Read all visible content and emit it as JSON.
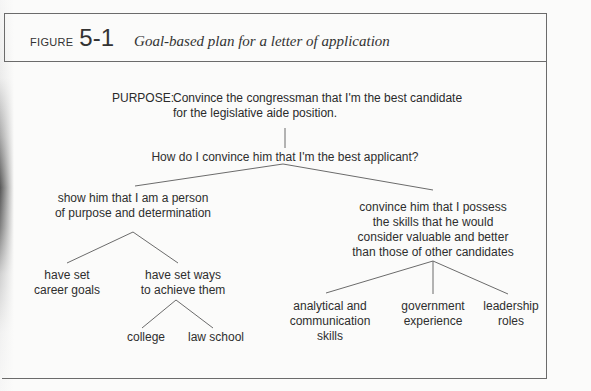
{
  "figure": {
    "label_word": "FIGURE",
    "number": "5-1",
    "caption": "Goal-based plan for a letter of application"
  },
  "purpose": {
    "label": "PURPOSE:",
    "line1": "Convince the congressman that I'm the best candidate",
    "line2": "for the legislative aide position."
  },
  "tree": {
    "question": "How do I convince him that I'm the best applicant?",
    "left": {
      "lines": [
        "show him that I am a person",
        "of purpose and determination"
      ],
      "children": [
        {
          "lines": [
            "have set",
            "career goals"
          ]
        },
        {
          "lines": [
            "have set ways",
            "to achieve them"
          ],
          "children": [
            {
              "lines": [
                "college"
              ]
            },
            {
              "lines": [
                "law school"
              ]
            }
          ]
        }
      ]
    },
    "right": {
      "lines": [
        "convince him that I possess",
        "the skills that he would",
        "consider valuable and better",
        "than those of other candidates"
      ],
      "children": [
        {
          "lines": [
            "analytical and",
            "communication",
            "skills"
          ]
        },
        {
          "lines": [
            "government",
            "experience"
          ]
        },
        {
          "lines": [
            "leadership",
            "roles"
          ]
        }
      ]
    }
  },
  "colors": {
    "line": "#6b6b6b",
    "text": "#2e2e2e",
    "paper": "#fbfbfa"
  }
}
